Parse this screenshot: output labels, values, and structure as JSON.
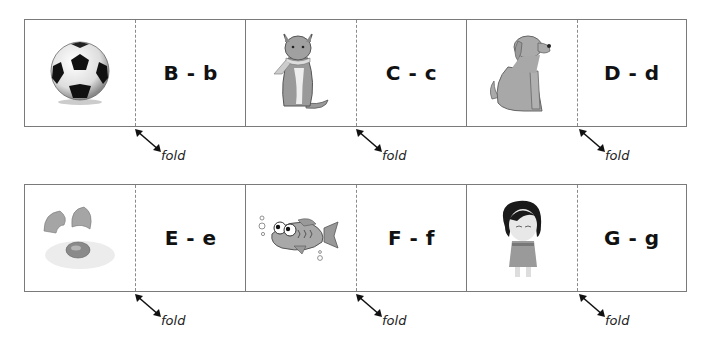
{
  "worksheet": {
    "fold_label": "fold",
    "rows": [
      {
        "cards": [
          {
            "picture": "soccer-ball",
            "label": "B - b"
          },
          {
            "picture": "cat",
            "label": "C - c"
          },
          {
            "picture": "dog",
            "label": "D - d"
          }
        ]
      },
      {
        "cards": [
          {
            "picture": "egg",
            "label": "E - e"
          },
          {
            "picture": "fish",
            "label": "F - f"
          },
          {
            "picture": "girl",
            "label": "G - g"
          }
        ]
      }
    ]
  },
  "colors": {
    "border": "#7a7a7a",
    "text": "#111111"
  }
}
